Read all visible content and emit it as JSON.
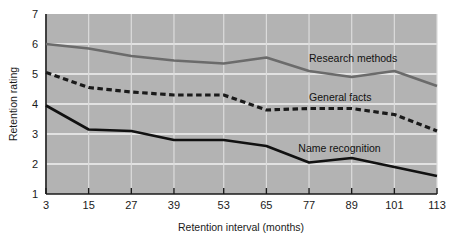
{
  "chart_data": {
    "type": "line",
    "title": "",
    "xlabel": "Retention interval (months)",
    "ylabel": "Retention rating",
    "categories": [
      "3",
      "15",
      "27",
      "39",
      "53",
      "65",
      "77",
      "89",
      "101",
      "113"
    ],
    "x": [
      3,
      15,
      27,
      39,
      53,
      65,
      77,
      89,
      101,
      113
    ],
    "xlim": [
      3,
      113
    ],
    "ylim": [
      1,
      7
    ],
    "yticks": [
      "1",
      "2",
      "3",
      "4",
      "5",
      "6",
      "7"
    ],
    "grid": true,
    "legend_position": "inline-annotations",
    "plot_background": "#b3b3b3",
    "series": [
      {
        "name": "Research methods",
        "style": "solid",
        "color": "#6b6b6b",
        "values": [
          6.0,
          5.85,
          5.6,
          5.45,
          5.35,
          5.55,
          5.1,
          4.9,
          5.1,
          4.6
        ]
      },
      {
        "name": "General facts",
        "style": "dashed",
        "color": "#1a1a1a",
        "values": [
          5.05,
          4.55,
          4.4,
          4.3,
          4.3,
          3.8,
          3.85,
          3.85,
          3.65,
          3.1
        ]
      },
      {
        "name": "Name recognition",
        "style": "solid",
        "color": "#111111",
        "values": [
          3.95,
          3.15,
          3.1,
          2.8,
          2.8,
          2.6,
          2.05,
          2.2,
          1.9,
          1.6
        ]
      }
    ],
    "annotations": [
      {
        "text": "Research methods",
        "x": 77,
        "y": 5.55
      },
      {
        "text": "General facts",
        "x": 77,
        "y": 4.25
      },
      {
        "text": "Name recognition",
        "x": 74,
        "y": 2.55
      }
    ]
  }
}
